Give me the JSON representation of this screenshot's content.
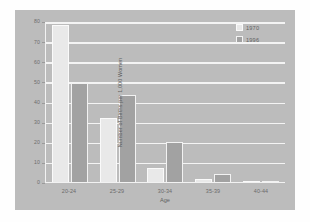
{
  "chart_data": {
    "type": "bar",
    "title": "",
    "subtitle": "",
    "xlabel": "Age",
    "ylabel": "Number of Births per 1,000 Women",
    "categories": [
      "20-24",
      "25-29",
      "30-34",
      "35-39",
      "40-44"
    ],
    "series": [
      {
        "name": "1970",
        "color": "#e9e9e9",
        "values": [
          78,
          32,
          7,
          1.5,
          0.5
        ]
      },
      {
        "name": "1996",
        "color": "#a2a2a2",
        "values": [
          49,
          43,
          20,
          4,
          0.3
        ]
      }
    ],
    "ylim": [
      0,
      80
    ],
    "ytick_labels": [
      "80",
      "70",
      "60",
      "50",
      "40",
      "30",
      "20",
      "10",
      "0"
    ],
    "ytick_values": [
      80,
      70,
      60,
      50,
      40,
      30,
      20,
      10,
      0
    ],
    "grid": true,
    "grid_axis": "y",
    "legend": [
      "1970",
      "1996"
    ],
    "legend_position": "top-right"
  },
  "figure": {
    "panel_color": "#bcbcbc",
    "grid_color": "#f4f4f4",
    "axis_color": "#f2f2f2",
    "background": "#fefefe"
  }
}
